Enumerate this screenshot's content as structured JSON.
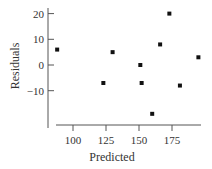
{
  "chart_data": {
    "type": "scatter",
    "title": "",
    "xlabel": "Predicted",
    "ylabel": "Residuals",
    "x_ticks": [
      100,
      125,
      150,
      175
    ],
    "y_ticks": [
      20,
      10,
      0,
      -10
    ],
    "x_tick_labels": [
      "100",
      "125",
      "150",
      "175"
    ],
    "y_tick_labels": [
      "20",
      "10",
      "0",
      "−10"
    ],
    "xlim": [
      85,
      200
    ],
    "ylim": [
      -24,
      22
    ],
    "grid": false,
    "legend": null,
    "series": [
      {
        "name": "residuals",
        "marker": "square",
        "color": "#111111",
        "points": [
          {
            "x": 88,
            "y": 6
          },
          {
            "x": 123,
            "y": -7
          },
          {
            "x": 130,
            "y": 5
          },
          {
            "x": 151,
            "y": 0
          },
          {
            "x": 152,
            "y": -7
          },
          {
            "x": 160,
            "y": -19
          },
          {
            "x": 166,
            "y": 8
          },
          {
            "x": 173,
            "y": 20
          },
          {
            "x": 181,
            "y": -8
          },
          {
            "x": 195,
            "y": 3
          }
        ]
      }
    ]
  }
}
